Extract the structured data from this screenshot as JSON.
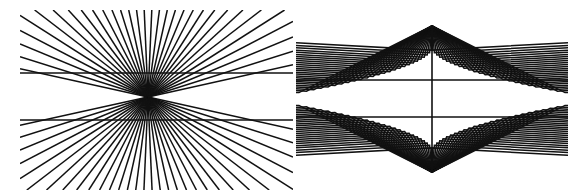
{
  "figure": {
    "width": 586,
    "height": 194,
    "background_color": "#ffffff",
    "stroke_color": "#111111",
    "panels": [
      {
        "id": "left-panel",
        "name": "hering-style-radiating-fan",
        "description": "Dense fan of straight rays converging to a single central point, crossed by two long horizontal lines which appear bowed.",
        "bounds": {
          "x": 20,
          "y": 10,
          "width": 273,
          "height": 180
        },
        "center": {
          "x": 148,
          "y": 97
        },
        "ray_count": 72,
        "ray_stroke_width": 1.5,
        "horizontal_lines": [
          {
            "y": 73,
            "x1": 20,
            "x2": 293,
            "stroke_width": 1.6
          },
          {
            "y": 120,
            "x1": 20,
            "x2": 293,
            "stroke_width": 1.6
          }
        ],
        "fan_angle_span_degrees": 360,
        "clip": {
          "x": 20,
          "y": 10,
          "width": 273,
          "height": 180
        }
      },
      {
        "id": "right-panel",
        "name": "chevron-double-apex-figure",
        "description": "Nested chevrons radiating from a top apex and a bottom apex, crossed by two horizontal lines and one central vertical line.",
        "bounds": {
          "x": 296,
          "y": 20,
          "width": 272,
          "height": 160
        },
        "top_apex": {
          "x": 432,
          "y": 26
        },
        "bottom_apex": {
          "x": 432,
          "y": 172
        },
        "chevron_count_per_side": 26,
        "chevron_stroke_width": 1.5,
        "horizontal_lines": [
          {
            "y": 80,
            "x1": 296,
            "x2": 568,
            "stroke_width": 1.6
          },
          {
            "y": 117,
            "x1": 296,
            "x2": 568,
            "stroke_width": 1.6
          }
        ],
        "vertical_line": {
          "x": 432,
          "y1": 26,
          "y2": 172,
          "stroke_width": 1.6
        },
        "clip": {
          "x": 296,
          "y": 14,
          "width": 272,
          "height": 172
        }
      }
    ]
  }
}
